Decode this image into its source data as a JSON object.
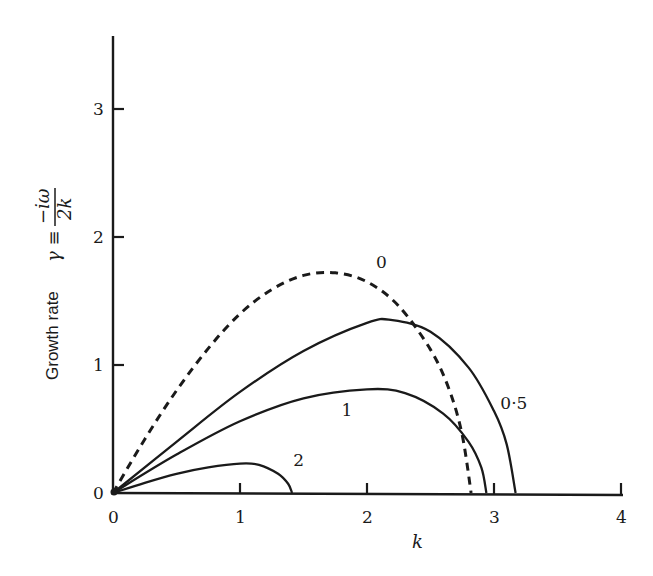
{
  "chart_data": {
    "type": "line",
    "title": "",
    "xlabel": "k",
    "ylabel": "Growth rate γ ≡ -iω/2k",
    "ylabel_parts": {
      "text": "Growth rate",
      "symbol": "γ ≡",
      "num": "−iω",
      "den": "2k"
    },
    "xlim": [
      0,
      4
    ],
    "ylim": [
      0,
      3.5
    ],
    "xticks": [
      "0",
      "1",
      "2",
      "3",
      "4"
    ],
    "yticks": [
      "0",
      "1",
      "2",
      "3"
    ],
    "grid": false,
    "legend": "curve labels inline",
    "series": [
      {
        "name": "0",
        "style": "dashed",
        "x": [
          0,
          0.25,
          0.5,
          0.75,
          1.0,
          1.25,
          1.5,
          1.75,
          2.0,
          2.25,
          2.5,
          2.65,
          2.75,
          2.82
        ],
        "y": [
          0,
          0.42,
          0.8,
          1.13,
          1.4,
          1.59,
          1.7,
          1.72,
          1.65,
          1.46,
          1.12,
          0.8,
          0.45,
          0
        ]
      },
      {
        "name": "0.5",
        "style": "solid",
        "x": [
          0,
          0.5,
          1.0,
          1.5,
          2.0,
          2.2,
          2.5,
          2.8,
          3.0,
          3.1,
          3.17
        ],
        "y": [
          0,
          0.4,
          0.79,
          1.11,
          1.33,
          1.35,
          1.26,
          0.98,
          0.64,
          0.38,
          0
        ]
      },
      {
        "name": "1",
        "style": "solid",
        "x": [
          0,
          0.5,
          1.0,
          1.5,
          2.0,
          2.3,
          2.6,
          2.8,
          2.9,
          2.94
        ],
        "y": [
          0,
          0.3,
          0.56,
          0.74,
          0.81,
          0.78,
          0.62,
          0.4,
          0.2,
          0
        ]
      },
      {
        "name": "2",
        "style": "solid",
        "x": [
          0,
          0.25,
          0.5,
          0.75,
          1.0,
          1.15,
          1.3,
          1.38,
          1.41
        ],
        "y": [
          0,
          0.08,
          0.15,
          0.2,
          0.23,
          0.22,
          0.15,
          0.07,
          0
        ]
      }
    ],
    "annotations": [
      {
        "text": "0",
        "x": 2.07,
        "y": 1.76
      },
      {
        "text": "0·5",
        "x": 3.05,
        "y": 0.66
      },
      {
        "text": "1",
        "x": 1.8,
        "y": 0.6
      },
      {
        "text": "2",
        "x": 1.42,
        "y": 0.21
      }
    ]
  }
}
